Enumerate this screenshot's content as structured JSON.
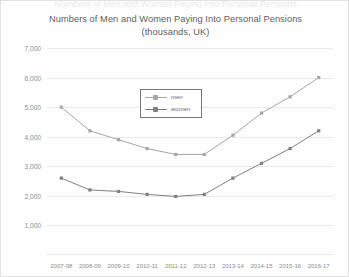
{
  "top_sliver_text": "Numbers of Men and Women Paying Into Personal Pensions",
  "chart_data": {
    "type": "line",
    "title_line1": "Numbers of Men and Women Paying Into Personal Pensions",
    "title_line2": "(thousands, UK)",
    "title": "Numbers of Men and Women Paying Into Personal Pensions (thousands, UK)",
    "xlabel": "",
    "ylabel": "",
    "ylim": [
      0,
      7000
    ],
    "ytick_labels": [
      "7,000",
      "6,000",
      "5,000",
      "4,000",
      "3,000",
      "2,000",
      "1,000"
    ],
    "ytick_values": [
      7000,
      6000,
      5000,
      4000,
      3000,
      2000,
      1000
    ],
    "grid": true,
    "legend_position": "upper-center",
    "categories": [
      "2007-08",
      "2008-09",
      "2009-10",
      "2010-11",
      "2011-12",
      "2012-13",
      "2013-14",
      "2014-15",
      "2015-16",
      "2016-17"
    ],
    "series": [
      {
        "name": "men",
        "color": "#a6a6a6",
        "values": [
          5000,
          4200,
          3900,
          3600,
          3400,
          3400,
          4050,
          4800,
          5350,
          6000
        ]
      },
      {
        "name": "women",
        "color": "#808080",
        "values": [
          2600,
          2200,
          2150,
          2050,
          1980,
          2050,
          2600,
          3100,
          3600,
          4200
        ]
      }
    ]
  }
}
